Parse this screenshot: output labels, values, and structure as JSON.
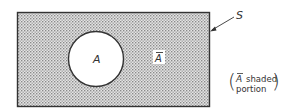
{
  "diagram": {
    "type": "venn",
    "universe": {
      "label": "S",
      "shaded": true
    },
    "set": {
      "label": "A",
      "shaded": false
    },
    "complement": {
      "label": "A",
      "bar": true
    },
    "caption": {
      "line1_symbol": "A",
      "line1_text": "shaded",
      "line2_text": "portion"
    }
  },
  "colors": {
    "shade": "#c9c9c9",
    "stroke": "#333333",
    "background": "#ffffff"
  }
}
